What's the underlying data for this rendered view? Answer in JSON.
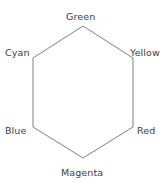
{
  "diagram": {
    "type": "hexagon-color-wheel",
    "background_color": "#ffffff",
    "stroke_color": "#808080",
    "stroke_width": 1,
    "text_color": "#3d3d3d",
    "canvas": {
      "width": 165,
      "height": 183
    },
    "shape": {
      "name": "hexagon",
      "vertices": [
        {
          "label": "Green",
          "x": 83,
          "y": 26
        },
        {
          "label": "Yellow",
          "x": 133,
          "y": 58
        },
        {
          "label": "Red",
          "x": 133,
          "y": 127
        },
        {
          "label": "Magenta",
          "x": 83,
          "y": 158
        },
        {
          "label": "Blue",
          "x": 33,
          "y": 127
        },
        {
          "label": "Cyan",
          "x": 33,
          "y": 58
        }
      ],
      "points_attr": "83,26 133,58 133,127 83,158 33,127 33,58"
    },
    "labels": {
      "green": "Green",
      "yellow": "Yellow",
      "red": "Red",
      "magenta": "Magenta",
      "blue": "Blue",
      "cyan": "Cyan"
    }
  }
}
